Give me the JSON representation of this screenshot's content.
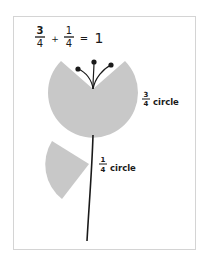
{
  "equation": {
    "term1": {
      "numerator": "3",
      "denominator": "4"
    },
    "plus": "+",
    "term2": {
      "numerator": "1",
      "denominator": "4"
    },
    "equals": "=",
    "result": "1"
  },
  "big_flower": {
    "label": {
      "numerator": "3",
      "denominator": "4",
      "text": "circle"
    },
    "fill_color": "#c8c8c8"
  },
  "leaf": {
    "label": {
      "numerator": "1",
      "denominator": "4",
      "text": "circle"
    },
    "fill_color": "#c8c8c8"
  },
  "stem_color": "#1a1a1a"
}
